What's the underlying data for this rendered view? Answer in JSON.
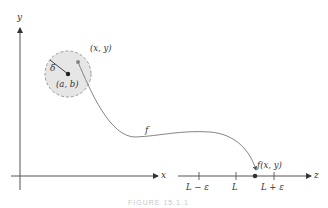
{
  "figure": {
    "caption": "FIGURE 15.1.1",
    "xy_plane": {
      "y_axis_label": "y",
      "x_axis_label": "x",
      "disk_center_label": "(a, b)",
      "disk_radius_label": "δ",
      "point_label": "(x, y)",
      "function_label": "f"
    },
    "z_line": {
      "axis_label": "z",
      "ticks": [
        {
          "label": "L − ε"
        },
        {
          "label": "L"
        },
        {
          "label": "L + ε"
        }
      ],
      "image_point_label": "f(x, y)"
    },
    "colors": {
      "axis": "#555555",
      "disk_fill": "#e6e6e6",
      "disk_border": "#999999",
      "curve": "#777777",
      "point": "#333333",
      "point_xy": "#888888"
    }
  }
}
